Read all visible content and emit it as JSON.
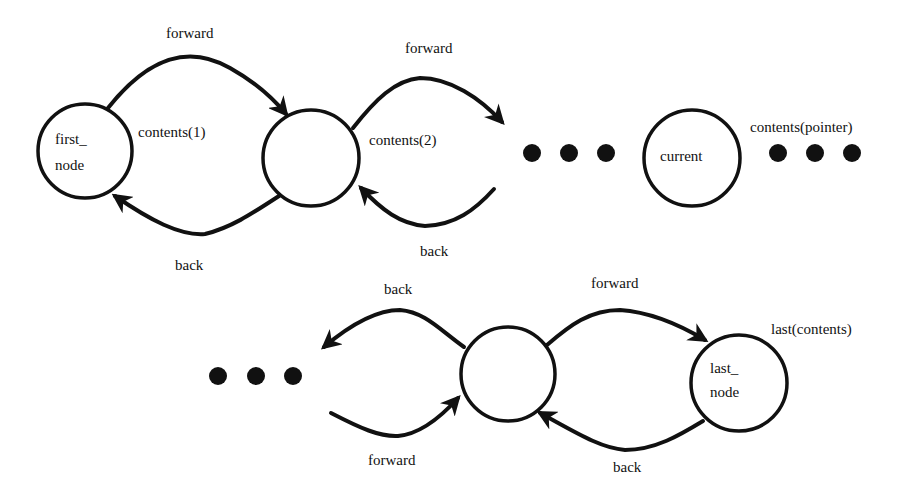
{
  "diagram": {
    "type": "doubly-linked-list",
    "nodes": [
      {
        "id": "first",
        "label_line1": "first_",
        "label_line2": "node",
        "content_label": "contents(1)"
      },
      {
        "id": "second",
        "label_line1": "",
        "label_line2": "",
        "content_label": "contents(2)"
      },
      {
        "id": "current",
        "label_line1": "current",
        "label_line2": "",
        "content_label": "contents(pointer)"
      },
      {
        "id": "penultimate",
        "label_line1": "",
        "label_line2": "",
        "content_label": ""
      },
      {
        "id": "last",
        "label_line1": "last_",
        "label_line2": "node",
        "content_label": "last(contents)"
      }
    ],
    "edges": [
      {
        "from": "first",
        "to": "second",
        "label": "forward"
      },
      {
        "from": "second",
        "to": "first",
        "label": "back"
      },
      {
        "from": "second",
        "to": "ellipsis-1",
        "label": "forward"
      },
      {
        "from": "ellipsis-1",
        "to": "second",
        "label": "back"
      },
      {
        "from": "penultimate",
        "to": "ellipsis-3",
        "label": "back"
      },
      {
        "from": "ellipsis-3",
        "to": "penultimate",
        "label": "forward"
      },
      {
        "from": "penultimate",
        "to": "last",
        "label": "forward"
      },
      {
        "from": "last",
        "to": "penultimate",
        "label": "back"
      }
    ],
    "ellipses": [
      "ellipsis-1",
      "ellipsis-2",
      "ellipsis-3"
    ]
  }
}
